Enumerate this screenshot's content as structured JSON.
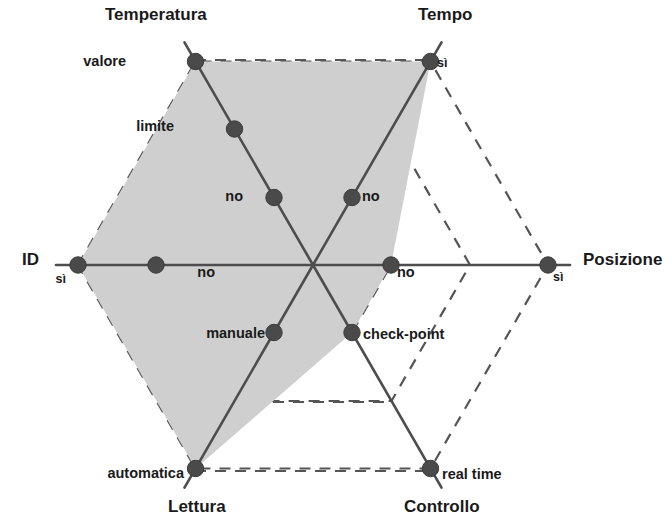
{
  "chart_data": {
    "type": "radar",
    "title": "",
    "subtitle": "",
    "xlabel": "",
    "ylabel": "",
    "grid": true,
    "legend": "none",
    "rings": 3,
    "center": {
      "x": 313,
      "y": 265
    },
    "ring_radii": [
      78,
      157,
      235
    ],
    "fill_color": "#cfcfcf",
    "line_color": "#4d4d4d",
    "dash_color": "#555555",
    "point_color": "#4a4a4a",
    "text_color": "#1a1a1a",
    "axes": [
      {
        "name": "ID",
        "angle_deg": 180,
        "title": "ID",
        "title_pos": {
          "x": 22,
          "y": 265
        },
        "ticks": [
          {
            "level": 3,
            "label": "sì",
            "selected": true,
            "label_pos": {
              "x": 66,
              "y": 283
            },
            "size": "sm"
          },
          {
            "level": 2,
            "label": "no",
            "selected": false,
            "label_pos": {
              "x": 215,
              "y": 277
            },
            "size": "md"
          }
        ]
      },
      {
        "name": "Temperatura",
        "angle_deg": 120,
        "title": "Temperatura",
        "title_pos": {
          "x": 105,
          "y": 20
        },
        "ticks": [
          {
            "level": 3,
            "label": "valore",
            "selected": true,
            "label_pos": {
              "x": 126,
              "y": 66
            },
            "size": "md"
          },
          {
            "level": 2,
            "label": "limite",
            "selected": false,
            "label_pos": {
              "x": 174,
              "y": 131
            },
            "size": "md"
          },
          {
            "level": 1,
            "label": "no",
            "selected": false,
            "label_pos": {
              "x": 243,
              "y": 201
            },
            "size": "md"
          }
        ]
      },
      {
        "name": "Tempo",
        "angle_deg": 60,
        "title": "Tempo",
        "title_pos": {
          "x": 418,
          "y": 20
        },
        "ticks": [
          {
            "level": 3,
            "label": "sì",
            "selected": true,
            "label_pos": {
              "x": 437,
              "y": 67
            },
            "size": "sm"
          },
          {
            "level": 1,
            "label": "no",
            "selected": false,
            "label_pos": {
              "x": 362,
              "y": 201
            },
            "size": "md"
          }
        ]
      },
      {
        "name": "Posizione",
        "angle_deg": 0,
        "title": "Posizione",
        "title_pos": {
          "x": 583,
          "y": 265
        },
        "ticks": [
          {
            "level": 3,
            "label": "sì",
            "selected": false,
            "label_pos": {
              "x": 553,
              "y": 281
            },
            "size": "sm"
          },
          {
            "level": 1,
            "label": "no",
            "selected": true,
            "label_pos": {
              "x": 397,
              "y": 277
            },
            "size": "md"
          }
        ]
      },
      {
        "name": "Controllo",
        "angle_deg": 300,
        "title": "Controllo",
        "title_pos": {
          "x": 404,
          "y": 512
        },
        "ticks": [
          {
            "level": 3,
            "label": "real time",
            "selected": false,
            "label_pos": {
              "x": 442,
              "y": 479
            },
            "size": "md"
          },
          {
            "level": 1,
            "label": "check-point",
            "selected": true,
            "label_pos": {
              "x": 363,
              "y": 339
            },
            "size": "md"
          }
        ]
      },
      {
        "name": "Lettura",
        "angle_deg": 240,
        "title": "Lettura",
        "title_pos": {
          "x": 168,
          "y": 512
        },
        "ticks": [
          {
            "level": 3,
            "label": "automatica",
            "selected": true,
            "label_pos": {
              "x": 184,
              "y": 478
            },
            "size": "md"
          },
          {
            "level": 1,
            "label": "manuale",
            "selected": false,
            "label_pos": {
              "x": 265,
              "y": 338
            },
            "size": "md"
          }
        ]
      }
    ],
    "series": [
      {
        "name": "configurazione",
        "points": [
          {
            "axis": "ID",
            "label": "sì",
            "level": 3
          },
          {
            "axis": "Temperatura",
            "label": "valore",
            "level": 3
          },
          {
            "axis": "Tempo",
            "label": "sì",
            "level": 3
          },
          {
            "axis": "Posizione",
            "label": "no",
            "level": 1
          },
          {
            "axis": "Controllo",
            "label": "check-point",
            "level": 1
          },
          {
            "axis": "Lettura",
            "label": "automatica",
            "level": 3
          }
        ]
      }
    ],
    "dashed_connectors": [
      {
        "from": {
          "x": 195,
          "y": 60
        },
        "to": {
          "x": 429,
          "y": 60
        }
      },
      {
        "from": {
          "x": 233,
          "y": 126
        },
        "to": {
          "x": 391,
          "y": 126
        }
      },
      {
        "from": {
          "x": 274,
          "y": 195
        },
        "to": {
          "x": 352,
          "y": 195
        }
      },
      {
        "from": {
          "x": 274,
          "y": 332
        },
        "to": {
          "x": 352,
          "y": 332
        }
      },
      {
        "from": {
          "x": 233,
          "y": 402
        },
        "to": {
          "x": 391,
          "y": 402
        }
      },
      {
        "from": {
          "x": 195,
          "y": 471
        },
        "to": {
          "x": 429,
          "y": 471
        }
      }
    ]
  }
}
